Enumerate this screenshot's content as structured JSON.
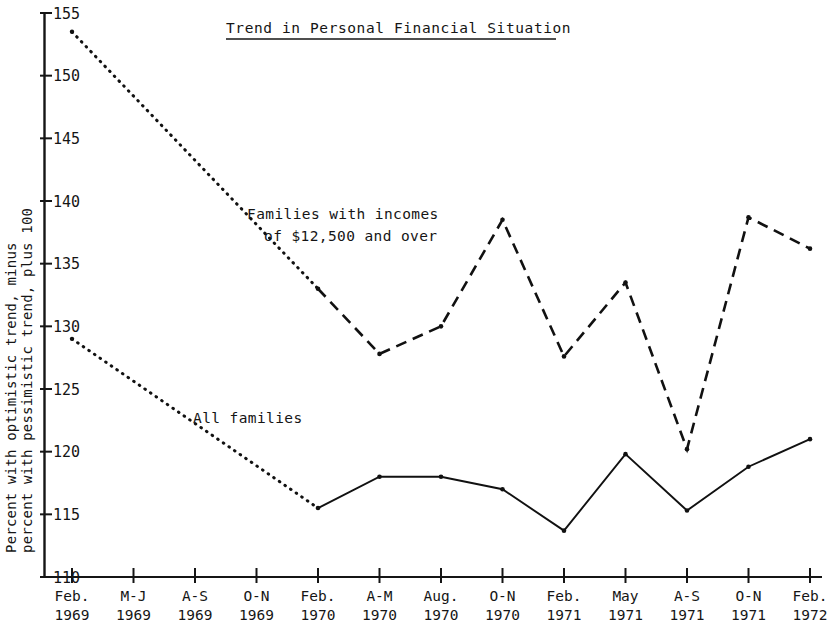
{
  "chart_data": {
    "type": "line",
    "title": "Trend in Personal Financial Situation",
    "title_underlined": true,
    "xlabel": "",
    "ylabel": "Percent with optimistic trend, minus percent with pessimistic trend, plus 100",
    "ylabel_line1": "Percent with optimistic trend, minus",
    "ylabel_line2": "percent with pessimistic trend, plus 100",
    "ylim": [
      110,
      155
    ],
    "ytick_values": [
      110,
      115,
      120,
      125,
      130,
      135,
      140,
      145,
      150,
      155
    ],
    "ytick_labels": [
      "110",
      "115",
      "120",
      "125",
      "130",
      "135",
      "140",
      "145",
      "150",
      "155"
    ],
    "grid": false,
    "legend_position": "inline-annotations",
    "categories": [
      "Feb. 1969",
      "M-J 1969",
      "A-S 1969",
      "O-N 1969",
      "Feb. 1970",
      "A-M 1970",
      "Aug. 1970",
      "O-N 1970",
      "Feb. 1971",
      "May 1971",
      "A-S 1971",
      "O-N 1971",
      "Feb. 1972"
    ],
    "xtick_labels_line1": [
      "Feb.",
      "M-J",
      "A-S",
      "O-N",
      "Feb.",
      "A-M",
      "Aug.",
      "O-N",
      "Feb.",
      "May",
      "A-S",
      "O-N",
      "Feb."
    ],
    "xtick_labels_line2": [
      "1969",
      "1969",
      "1969",
      "1969",
      "1970",
      "1970",
      "1970",
      "1970",
      "1971",
      "1971",
      "1971",
      "1971",
      "1972"
    ],
    "series": [
      {
        "name": "Families with incomes of $12,500 and over",
        "annotation_line1": "Families with incomes",
        "annotation_line2": "of $12,500 and over",
        "style": "dashed",
        "interpolated_style": "dotted",
        "interpolated_range": [
          0,
          4
        ],
        "color": "#111111",
        "values": [
          153.5,
          null,
          null,
          null,
          133.0,
          127.8,
          130.0,
          138.5,
          127.6,
          133.5,
          120.2,
          138.7,
          136.2
        ]
      },
      {
        "name": "All families",
        "annotation_line1": "All families",
        "style": "solid",
        "interpolated_style": "dotted",
        "interpolated_range": [
          0,
          4
        ],
        "color": "#111111",
        "values": [
          129.0,
          null,
          null,
          null,
          115.5,
          118.0,
          118.0,
          117.0,
          113.7,
          119.8,
          115.3,
          118.8,
          121.0
        ]
      }
    ],
    "axis_color": "#151515"
  },
  "annotations": {
    "upper_series_label_line1": "Families with incomes",
    "upper_series_label_line2": "of $12,500 and over",
    "lower_series_label": "All families"
  }
}
